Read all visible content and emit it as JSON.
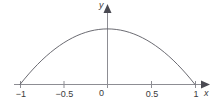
{
  "figure": {
    "name": "parabola-plot",
    "background_color": "#ffffff",
    "curve_color": "#5a5a62",
    "axis_color": "#8d8d93",
    "text_color": "#3a3a3a"
  },
  "axes": {
    "x_axis_label": "x",
    "y_axis_label": "y",
    "origin_label": "0",
    "x_ticks": [
      {
        "label": "−1",
        "value": -1
      },
      {
        "label": "−0.5",
        "value": -0.5
      },
      {
        "label": "0.5",
        "value": 0.5
      },
      {
        "label": "1",
        "value": 1
      }
    ],
    "has_x_arrow": true,
    "has_y_arrow": true,
    "grid": "off"
  },
  "chart_data": {
    "type": "line",
    "title": "",
    "subtitle": "",
    "xlabel": "x",
    "ylabel": "y",
    "xlim": [
      -1.18,
      1.18
    ],
    "ylim": [
      0,
      1.3
    ],
    "xticks": [
      -1,
      -0.5,
      0.5,
      1
    ],
    "xticklabels": [
      "−1",
      "−0.5",
      "0.5",
      "1"
    ],
    "yticks": [],
    "yticklabels": [],
    "grid": false,
    "legend": null,
    "annotations": [],
    "series": [
      {
        "name": "y = 1 - x^2",
        "color": "#5a5a62",
        "x": [
          -1,
          -0.95,
          -0.9,
          -0.85,
          -0.8,
          -0.75,
          -0.7,
          -0.65,
          -0.6,
          -0.55,
          -0.5,
          -0.45,
          -0.4,
          -0.35,
          -0.3,
          -0.25,
          -0.2,
          -0.15,
          -0.1,
          -0.05,
          0,
          0.05,
          0.1,
          0.15,
          0.2,
          0.25,
          0.3,
          0.35,
          0.4,
          0.45,
          0.5,
          0.55,
          0.6,
          0.65,
          0.7,
          0.75,
          0.8,
          0.85,
          0.9,
          0.95,
          1
        ],
        "y": [
          0,
          0.0975,
          0.19,
          0.2775,
          0.36,
          0.4375,
          0.51,
          0.5775,
          0.64,
          0.6975,
          0.75,
          0.7975,
          0.84,
          0.8775,
          0.91,
          0.9375,
          0.96,
          0.9775,
          0.99,
          0.9975,
          1,
          0.9975,
          0.99,
          0.9775,
          0.96,
          0.9375,
          0.91,
          0.8775,
          0.84,
          0.7975,
          0.75,
          0.6975,
          0.64,
          0.5775,
          0.51,
          0.4375,
          0.36,
          0.2775,
          0.19,
          0.0975,
          0
        ]
      }
    ]
  }
}
